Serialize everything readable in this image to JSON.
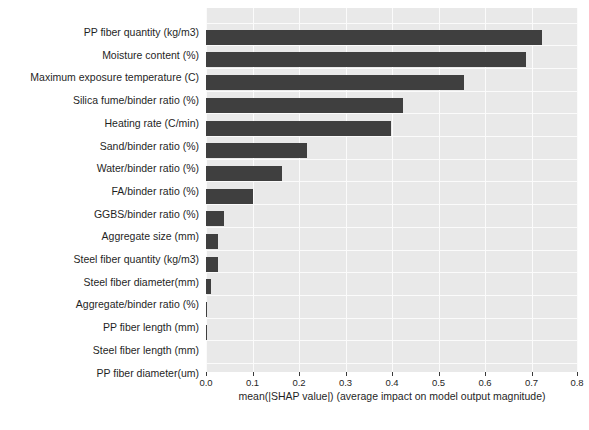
{
  "chart_data": {
    "type": "bar",
    "orientation": "horizontal",
    "title": "",
    "xlabel": "mean(|SHAP value|) (average impact on model output magnitude)",
    "ylabel": "",
    "xlim": [
      0.0,
      0.8
    ],
    "xticks": [
      "0.0",
      "0.1",
      "0.2",
      "0.3",
      "0.4",
      "0.5",
      "0.6",
      "0.7",
      "0.8"
    ],
    "xtick_values": [
      0.0,
      0.1,
      0.2,
      0.3,
      0.4,
      0.5,
      0.6,
      0.7,
      0.8
    ],
    "grid": true,
    "legend": "none",
    "bar_color": "#3f3f3f",
    "plot_background": "#e9e9e9",
    "categories": [
      "PP fiber quantity (kg/m3)",
      "Moisture content (%)",
      "Maximum exposure temperature (C)",
      "Silica fume/binder ratio (%)",
      "Heating rate (C/min)",
      "Sand/binder ratio (%)",
      "Water/binder ratio (%)",
      "FA/binder ratio (%)",
      "GGBS/binder ratio (%)",
      "Aggregate size (mm)",
      "Steel fiber quantity (kg/m3)",
      "Steel fiber diameter(mm)",
      "Aggregate/binder ratio (%)",
      "PP fiber length (mm)",
      "Steel fiber length (mm)",
      "PP fiber diameter(um)"
    ],
    "values": [
      0.722,
      0.688,
      0.554,
      0.423,
      0.398,
      0.217,
      0.163,
      0.102,
      0.038,
      0.025,
      0.025,
      0.011,
      0.003,
      0.003,
      0.0,
      0.0
    ]
  }
}
